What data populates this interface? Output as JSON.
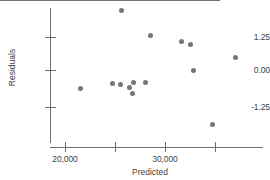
{
  "chart_data": {
    "type": "scatter",
    "title": "",
    "xlabel": "Predicted",
    "ylabel": "Residuals",
    "xlim": [
      17500,
      38600
    ],
    "ylim": [
      -2.6,
      2.3
    ],
    "grid": false,
    "legend": null,
    "reference_line": {
      "orientation": "horizontal",
      "y": 0.0
    },
    "x_ticks": [
      20000,
      25000,
      30000,
      35000
    ],
    "x_tick_labels": [
      "20,000",
      "",
      "30,000",
      ""
    ],
    "y_ticks": [
      1.25,
      0.0,
      -1.25
    ],
    "y_tick_labels": [
      "1.25",
      "0.00",
      "-1.25"
    ],
    "points": [
      {
        "x": 25600,
        "y": 2.25
      },
      {
        "x": 28500,
        "y": 1.32
      },
      {
        "x": 31600,
        "y": 1.07
      },
      {
        "x": 32500,
        "y": 0.96
      },
      {
        "x": 37000,
        "y": 0.46
      },
      {
        "x": 32800,
        "y": 0.0
      },
      {
        "x": 26800,
        "y": -0.46
      },
      {
        "x": 28000,
        "y": -0.46
      },
      {
        "x": 24700,
        "y": -0.5
      },
      {
        "x": 25500,
        "y": -0.54
      },
      {
        "x": 26400,
        "y": -0.68
      },
      {
        "x": 21500,
        "y": -0.71
      },
      {
        "x": 26700,
        "y": -0.89
      },
      {
        "x": 34700,
        "y": -2.07
      }
    ],
    "series_color": "#757575",
    "axis_color": "#6f6f6f",
    "marker_size_px": 5
  }
}
